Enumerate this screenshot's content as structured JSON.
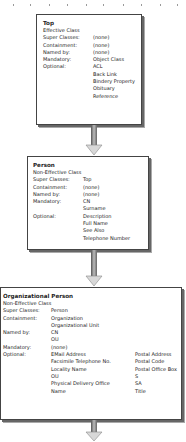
{
  "classes": [
    {
      "name": "Top",
      "kind": "Effective Class",
      "attributes": [
        {
          "label": "Super Classes:",
          "values": [
            "(none)"
          ]
        },
        {
          "label": "Containment:",
          "values": [
            "(none)"
          ]
        },
        {
          "label": "Named by:",
          "values": [
            "(none)"
          ]
        },
        {
          "label": "Mandatory:",
          "values": [
            "Object Class"
          ]
        },
        {
          "label": "Optional:",
          "values": [
            "ACL",
            "Back Link",
            "Bindery Property",
            "Obituary",
            "Reference"
          ]
        }
      ]
    },
    {
      "name": "Person",
      "kind": "Non-Effective Class",
      "attributes": [
        {
          "label": "Super Classes:",
          "values": [
            "Top"
          ]
        },
        {
          "label": "Containment:",
          "values": [
            "(none)"
          ]
        },
        {
          "label": "Named by:",
          "values": [
            "(none)"
          ]
        },
        {
          "label": "Mandatory:",
          "values": [
            "CN",
            "Surname"
          ]
        },
        {
          "label": "Optional:",
          "values": [
            "Description",
            "Full Name",
            "See Also",
            "Telephone Number"
          ]
        }
      ]
    },
    {
      "name": "Organizational Person",
      "kind": "Non-Effective Class",
      "attributes": [
        {
          "label": "Super Classes:",
          "values": [
            "Person"
          ]
        },
        {
          "label": "Containment:",
          "values": [
            "Organization",
            "Organizational Unit"
          ]
        },
        {
          "label": "Named by:",
          "values": [
            "CN",
            "OU"
          ]
        },
        {
          "label": "Mandatory:",
          "values": [
            "(none)"
          ]
        },
        {
          "label": "Optional:",
          "values": [
            "EMail Address",
            "Facsimile Telephone No.",
            "Locality Name",
            "OU",
            "Physical Delivery Office",
            "Name"
          ],
          "values_col2": [
            "Postal Address",
            "Postal Code",
            "Postal Office Box",
            "S",
            "SA",
            "Title"
          ]
        }
      ]
    }
  ],
  "arrows": [
    {
      "from": "Top",
      "to": "Person",
      "icon": "down-arrow-icon"
    },
    {
      "from": "Person",
      "to": "Organizational Person",
      "icon": "down-arrow-icon"
    },
    {
      "from": "Organizational Person",
      "to": "continues",
      "icon": "down-arrow-icon"
    }
  ]
}
